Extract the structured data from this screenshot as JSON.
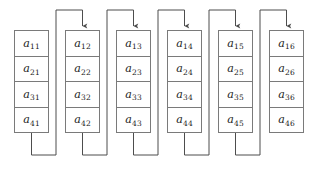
{
  "diagram": {
    "type": "column-major-linked-array",
    "canvas": {
      "width": 313,
      "height": 170
    },
    "colors": {
      "background": "#ffffff",
      "cell_border": "#7a7a7a",
      "cell_fill": "#ffffff",
      "connector": "#4d4d4d",
      "label_text": "#1a1a1a"
    },
    "geometry": {
      "column_count": 6,
      "rows_per_column": 4,
      "cell_width": 35,
      "cell_height": 26.5,
      "column_spacing": 51,
      "first_column_x": 14,
      "stack_top_y": 30,
      "top_rail_y": 10,
      "bottom_rail_y": 155
    },
    "columns": [
      {
        "index": 1,
        "name": "column-1",
        "cells": [
          {
            "base": "a",
            "sub": "11"
          },
          {
            "base": "a",
            "sub": "21"
          },
          {
            "base": "a",
            "sub": "31"
          },
          {
            "base": "a",
            "sub": "41"
          }
        ]
      },
      {
        "index": 2,
        "name": "column-2",
        "cells": [
          {
            "base": "a",
            "sub": "12"
          },
          {
            "base": "a",
            "sub": "22"
          },
          {
            "base": "a",
            "sub": "32"
          },
          {
            "base": "a",
            "sub": "42"
          }
        ]
      },
      {
        "index": 3,
        "name": "column-3",
        "cells": [
          {
            "base": "a",
            "sub": "13"
          },
          {
            "base": "a",
            "sub": "23"
          },
          {
            "base": "a",
            "sub": "33"
          },
          {
            "base": "a",
            "sub": "43"
          }
        ]
      },
      {
        "index": 4,
        "name": "column-4",
        "cells": [
          {
            "base": "a",
            "sub": "14"
          },
          {
            "base": "a",
            "sub": "24"
          },
          {
            "base": "a",
            "sub": "34"
          },
          {
            "base": "a",
            "sub": "44"
          }
        ]
      },
      {
        "index": 5,
        "name": "column-5",
        "cells": [
          {
            "base": "a",
            "sub": "15"
          },
          {
            "base": "a",
            "sub": "25"
          },
          {
            "base": "a",
            "sub": "35"
          },
          {
            "base": "a",
            "sub": "45"
          }
        ]
      },
      {
        "index": 6,
        "name": "column-6",
        "cells": [
          {
            "base": "a",
            "sub": "16"
          },
          {
            "base": "a",
            "sub": "26"
          },
          {
            "base": "a",
            "sub": "36"
          },
          {
            "base": "a",
            "sub": "46"
          }
        ]
      }
    ],
    "connectors": [
      {
        "name": "connector-1-to-2",
        "from_column": 1,
        "to_column": 2,
        "arrowhead": "down"
      },
      {
        "name": "connector-2-to-3",
        "from_column": 2,
        "to_column": 3,
        "arrowhead": "down"
      },
      {
        "name": "connector-3-to-4",
        "from_column": 3,
        "to_column": 4,
        "arrowhead": "down"
      },
      {
        "name": "connector-4-to-5",
        "from_column": 4,
        "to_column": 5,
        "arrowhead": "down"
      },
      {
        "name": "connector-5-to-6",
        "from_column": 5,
        "to_column": 6,
        "arrowhead": "down"
      }
    ]
  }
}
